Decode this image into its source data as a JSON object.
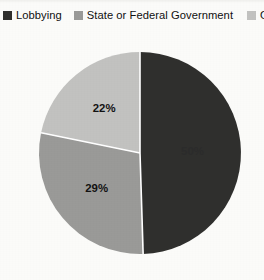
{
  "legend": {
    "position": "top",
    "items": [
      {
        "label": "Lobbying",
        "color": "#2f2f2d",
        "swatch_icon": "square-swatch-icon"
      },
      {
        "label": "State or Federal Government",
        "color": "#9a9a98",
        "swatch_icon": "square-swatch-icon"
      },
      {
        "label": "Other",
        "color": "#c2c2c0",
        "swatch_icon": "square-swatch-icon"
      }
    ]
  },
  "labels": {
    "lobbying": "50%",
    "state_or_federal_government": "29%",
    "other": "22%"
  },
  "chart_data": {
    "type": "pie",
    "title": "",
    "categories": [
      "Lobbying",
      "State or Federal Government",
      "Other"
    ],
    "values": [
      50,
      29,
      22
    ],
    "data_labels": [
      "50%",
      "29%",
      "22%"
    ],
    "colors": [
      "#2f2f2d",
      "#9a9a98",
      "#c2c2c0"
    ],
    "units": "percent",
    "start_angle_deg": 0,
    "direction": "clockwise",
    "legend": true,
    "legend_position": "top",
    "grid": false,
    "slice_separator_color": "#ffffff",
    "background": "#fbfbf9"
  }
}
